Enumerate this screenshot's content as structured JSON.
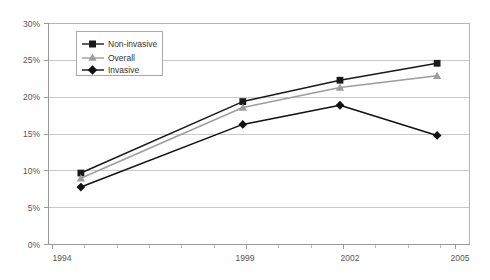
{
  "chart_data": {
    "type": "line",
    "title": "",
    "xlabel": "",
    "ylabel": "",
    "x": [
      1994,
      1999,
      2002,
      2005
    ],
    "categories": [
      "1994",
      "1999",
      "2002",
      "2005"
    ],
    "xlim": [
      1993,
      2006
    ],
    "ylim": [
      0,
      30
    ],
    "y_ticks": [
      0,
      5,
      10,
      15,
      20,
      25,
      30
    ],
    "y_tick_labels": [
      "0%",
      "5%",
      "10%",
      "15%",
      "20%",
      "25%",
      "30%"
    ],
    "x_tick_labels": [
      "1994",
      "1999",
      "2002",
      "2005"
    ],
    "grid": "horizontal",
    "legend_position": "upper-left-inside",
    "series": [
      {
        "name": "Non-invasive",
        "marker": "square",
        "color": "#1a1a1a",
        "values": [
          9.7,
          19.4,
          22.3,
          24.6
        ]
      },
      {
        "name": "Overall",
        "marker": "triangle",
        "color": "#9d9d9d",
        "values": [
          9.0,
          18.6,
          21.3,
          22.9
        ]
      },
      {
        "name": "Invasive",
        "marker": "diamond",
        "color": "#111111",
        "values": [
          7.8,
          16.3,
          18.9,
          14.8
        ]
      }
    ]
  },
  "axes": {
    "y_labels": [
      "30%",
      "25%",
      "20%",
      "15%",
      "10%",
      "5%",
      "0%"
    ],
    "x_labels": [
      "1994",
      "1999",
      "2002",
      "2005"
    ]
  },
  "legend": {
    "items": [
      {
        "label": "Non-invasive"
      },
      {
        "label": "Overall"
      },
      {
        "label": "Invasive"
      }
    ]
  },
  "colors": {
    "non_invasive": "#1a1a1a",
    "overall": "#9d9d9d",
    "invasive": "#111111",
    "gridline": "#c8c8c8",
    "axis": "#9a9a9a",
    "plot_border": "#b5b5b5",
    "background": "#ffffff",
    "tick_text": "#555555"
  }
}
